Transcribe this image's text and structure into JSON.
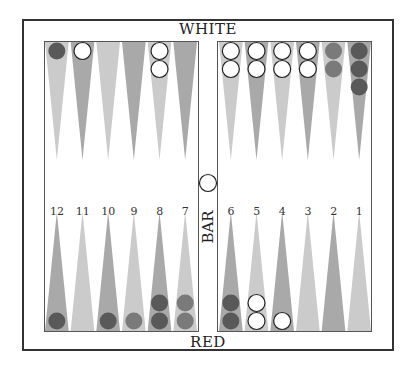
{
  "labels": {
    "top": "WHITE",
    "bottom": "RED",
    "bar": "BAR"
  },
  "colors": {
    "triangle_light": "#cbcbcb",
    "triangle_dark": "#a9a9a9",
    "checker_white": "#ffffff",
    "checker_dark_red": "#595959",
    "checker_red": "#7a7a7a",
    "frame": "#333333"
  },
  "point_numbers": [
    "12",
    "11",
    "10",
    "9",
    "8",
    "7",
    "6",
    "5",
    "4",
    "3",
    "2",
    "1"
  ],
  "top_row": [
    {
      "point": "12",
      "checkers": [
        {
          "color": "dark"
        }
      ]
    },
    {
      "point": "11",
      "checkers": [
        {
          "color": "white"
        }
      ]
    },
    {
      "point": "10",
      "checkers": []
    },
    {
      "point": "9",
      "checkers": []
    },
    {
      "point": "8",
      "checkers": [
        {
          "color": "white"
        },
        {
          "color": "white"
        }
      ]
    },
    {
      "point": "7",
      "checkers": []
    },
    {
      "point": "6",
      "checkers": [
        {
          "color": "white"
        },
        {
          "color": "white"
        }
      ]
    },
    {
      "point": "5",
      "checkers": [
        {
          "color": "white"
        },
        {
          "color": "white"
        }
      ]
    },
    {
      "point": "4",
      "checkers": [
        {
          "color": "white"
        },
        {
          "color": "white"
        }
      ]
    },
    {
      "point": "3",
      "checkers": [
        {
          "color": "white"
        },
        {
          "color": "white"
        }
      ]
    },
    {
      "point": "2",
      "checkers": [
        {
          "color": "red"
        },
        {
          "color": "red"
        }
      ]
    },
    {
      "point": "1",
      "checkers": [
        {
          "color": "dark"
        },
        {
          "color": "dark"
        },
        {
          "color": "dark"
        }
      ]
    }
  ],
  "bottom_row": [
    {
      "col": 1,
      "checkers": [
        {
          "color": "dark"
        }
      ]
    },
    {
      "col": 2,
      "checkers": []
    },
    {
      "col": 3,
      "checkers": [
        {
          "color": "dark"
        }
      ]
    },
    {
      "col": 4,
      "checkers": [
        {
          "color": "red"
        }
      ]
    },
    {
      "col": 5,
      "checkers": [
        {
          "color": "dark"
        },
        {
          "color": "dark"
        }
      ]
    },
    {
      "col": 6,
      "checkers": [
        {
          "color": "red"
        },
        {
          "color": "red"
        }
      ]
    },
    {
      "col": 7,
      "checkers": [
        {
          "color": "dark"
        },
        {
          "color": "dark"
        }
      ]
    },
    {
      "col": 8,
      "checkers": [
        {
          "color": "white"
        },
        {
          "color": "white"
        }
      ]
    },
    {
      "col": 9,
      "checkers": [
        {
          "color": "white"
        }
      ]
    },
    {
      "col": 10,
      "checkers": []
    },
    {
      "col": 11,
      "checkers": []
    },
    {
      "col": 12,
      "checkers": []
    }
  ],
  "bar_checkers": [
    {
      "color": "white"
    }
  ]
}
